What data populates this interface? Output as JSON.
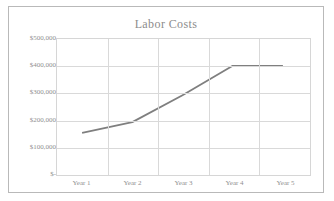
{
  "chart_data": {
    "type": "line",
    "title": "Labor Costs",
    "xlabel": "",
    "ylabel": "",
    "categories": [
      "Year 1",
      "Year 2",
      "Year 3",
      "Year 4",
      "Year 5"
    ],
    "values": [
      150000,
      190000,
      290000,
      400000,
      400000
    ],
    "series": [
      {
        "name": "Labor Costs",
        "values": [
          150000,
          190000,
          290000,
          400000,
          400000
        ],
        "color": "#7f7f7f"
      }
    ],
    "ylim": [
      0,
      500000
    ],
    "ytick_values": [
      500000,
      400000,
      300000,
      200000,
      100000,
      0
    ],
    "ytick_labels": [
      "$500,000",
      "$400,000",
      "$300,000",
      "$200,000",
      "$100,000",
      "$-"
    ],
    "xtick_labels": [
      "Year 1",
      "Year 2",
      "Year 3",
      "Year 4",
      "Year 5"
    ],
    "grid": true,
    "legend": false,
    "legend_position": "none",
    "markers": false,
    "line_color": "#7f7f7f",
    "grid_color": "#d9d9d9",
    "text_color": "#8f8f8f",
    "border_color": "#b9b9b9",
    "background": "#ffffff"
  }
}
